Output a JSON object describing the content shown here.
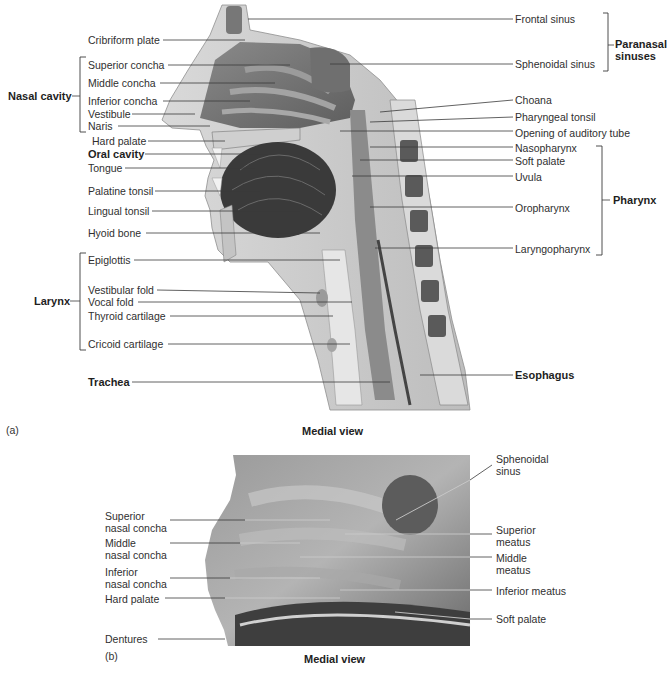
{
  "panel_a": {
    "letter": "(a)",
    "caption": "Medial view",
    "left_labels": [
      "Cribriform plate",
      "Superior concha",
      "Middle concha",
      "Inferior concha",
      "Vestibule",
      "Naris",
      "Hard palate",
      "Oral cavity",
      "Tongue",
      "Palatine tonsil",
      "Lingual tonsil",
      "Hyoid bone",
      "Epiglottis",
      "Vestibular fold",
      "Vocal fold",
      "Thyroid cartilage",
      "Cricoid cartilage",
      "Trachea"
    ],
    "right_labels": [
      "Frontal sinus",
      "Sphenoidal sinus",
      "Choana",
      "Pharyngeal tonsil",
      "Opening of auditory tube",
      "Nasopharynx",
      "Soft palate",
      "Uvula",
      "Oropharynx",
      "Laryngopharynx",
      "Esophagus"
    ],
    "groups": {
      "nasal_cavity": "Nasal cavity",
      "larynx": "Larynx",
      "paranasal_sinuses_1": "Paranasal",
      "paranasal_sinuses_2": "sinuses",
      "pharynx": "Pharynx"
    }
  },
  "panel_b": {
    "letter": "(b)",
    "caption": "Medial view",
    "left_labels": [
      [
        "Superior",
        "nasal concha"
      ],
      [
        "Middle",
        "nasal concha"
      ],
      [
        "Inferior",
        "nasal concha"
      ],
      [
        "Hard palate"
      ],
      [
        "Dentures"
      ]
    ],
    "right_labels": [
      [
        "Sphenoidal",
        "sinus"
      ],
      [
        "Superior",
        "meatus"
      ],
      [
        "Middle",
        "meatus"
      ],
      [
        "Inferior meatus"
      ],
      [
        "Soft palate"
      ]
    ]
  }
}
